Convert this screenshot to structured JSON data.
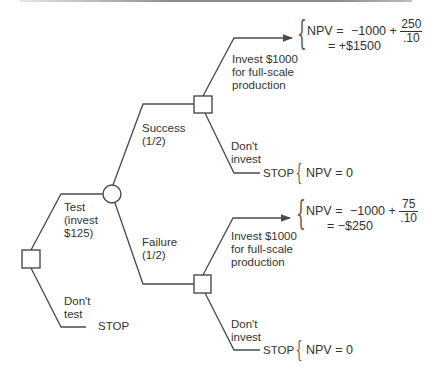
{
  "diagram": {
    "type": "decision-tree",
    "nodes": {
      "root_decision": {
        "shape": "square"
      },
      "chance_test_result": {
        "shape": "circle"
      },
      "decision_after_success": {
        "shape": "square"
      },
      "decision_after_failure": {
        "shape": "square"
      }
    },
    "branches": {
      "test": {
        "line1": "Test",
        "line2": "(invest",
        "line3": "$125)"
      },
      "dont_test": {
        "line1": "Don't",
        "line2": "test"
      },
      "success": {
        "line1": "Success",
        "line2": "(1/2)"
      },
      "failure": {
        "line1": "Failure",
        "line2": "(1/2)"
      },
      "invest_success": {
        "line1": "Invest $1000",
        "line2": "for full-scale",
        "line3": "production"
      },
      "dont_invest_success": {
        "line1": "Don't",
        "line2": "invest"
      },
      "invest_failure": {
        "line1": "Invest $1000",
        "line2": "for full-scale",
        "line3": "production"
      },
      "dont_invest_failure": {
        "line1": "Don't",
        "line2": "invest"
      }
    },
    "terminals": {
      "stop_label": "STOP",
      "success_invest": {
        "lhs": "NPV =",
        "expr": "−1000 +",
        "num": "250",
        "den": ".10",
        "result": "= +$1500"
      },
      "success_dont_invest": {
        "npv": "NPV = 0"
      },
      "failure_invest": {
        "lhs": "NPV =",
        "expr": "−1000 +",
        "num": "75",
        "den": ".10",
        "result": "= −$250"
      },
      "failure_dont_invest": {
        "npv": "NPV = 0"
      }
    },
    "colors": {
      "line": "#4a4a4a",
      "text": "#333333",
      "background": "#ffffff"
    }
  }
}
